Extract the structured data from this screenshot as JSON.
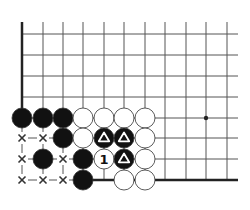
{
  "diagram": {
    "type": "go-board-fragment",
    "grid": {
      "columns_x": [
        22,
        43,
        63,
        83,
        104,
        124,
        145,
        165,
        186,
        206,
        227
      ],
      "rows_y": [
        34,
        55,
        76,
        97,
        118,
        138,
        159,
        180
      ],
      "line_right_x": 238,
      "line_top_y": 22,
      "line_color": "#555555",
      "edge_color": "#222222"
    },
    "edges": {
      "left": {
        "x": 22,
        "from_y": 22,
        "to_y": 118
      },
      "bottom": {
        "y": 180,
        "from_x": 83,
        "to_x": 238
      }
    },
    "hoshi": [
      {
        "col": 9,
        "row": 4
      }
    ],
    "stones": [
      {
        "col": 0,
        "row": 4,
        "color": "black"
      },
      {
        "col": 1,
        "row": 4,
        "color": "black"
      },
      {
        "col": 2,
        "row": 4,
        "color": "black"
      },
      {
        "col": 3,
        "row": 4,
        "color": "white"
      },
      {
        "col": 4,
        "row": 4,
        "color": "white"
      },
      {
        "col": 5,
        "row": 4,
        "color": "white"
      },
      {
        "col": 6,
        "row": 4,
        "color": "white"
      },
      {
        "col": 2,
        "row": 5,
        "color": "black"
      },
      {
        "col": 3,
        "row": 5,
        "color": "white"
      },
      {
        "col": 4,
        "row": 5,
        "color": "black",
        "mark": "triangle"
      },
      {
        "col": 5,
        "row": 5,
        "color": "black",
        "mark": "triangle"
      },
      {
        "col": 6,
        "row": 5,
        "color": "white"
      },
      {
        "col": 1,
        "row": 6,
        "color": "black"
      },
      {
        "col": 3,
        "row": 6,
        "color": "black"
      },
      {
        "col": 4,
        "row": 6,
        "color": "white",
        "label": "1"
      },
      {
        "col": 5,
        "row": 6,
        "color": "black",
        "mark": "triangle"
      },
      {
        "col": 6,
        "row": 6,
        "color": "white"
      },
      {
        "col": 3,
        "row": 7,
        "color": "black"
      },
      {
        "col": 5,
        "row": 7,
        "color": "white"
      },
      {
        "col": 6,
        "row": 7,
        "color": "white"
      }
    ],
    "x_marks": [
      {
        "col": 0,
        "row": 5
      },
      {
        "col": 1,
        "row": 5
      },
      {
        "col": 0,
        "row": 6
      },
      {
        "col": 2,
        "row": 6
      },
      {
        "col": 0,
        "row": 7
      },
      {
        "col": 1,
        "row": 7
      },
      {
        "col": 2,
        "row": 7
      }
    ],
    "stone_radius": 10,
    "colors": {
      "black": "#111111",
      "white": "#ffffff",
      "stone_outline": "#333333",
      "mark_on_black": "#ffffff",
      "x_mark": "#333333"
    }
  }
}
